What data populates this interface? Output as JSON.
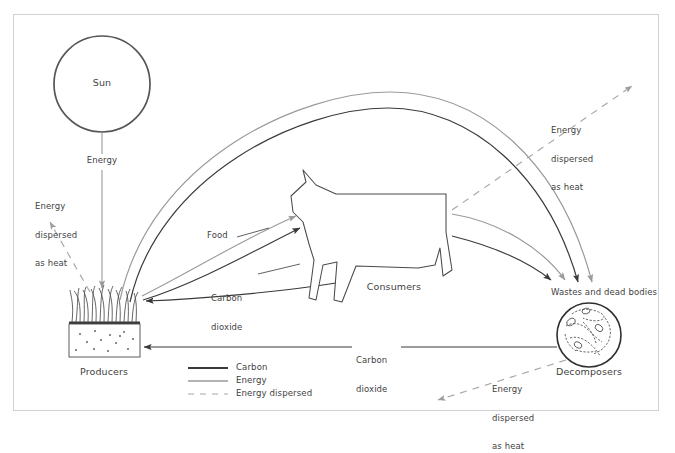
{
  "figure": {
    "frame_color": "#cfcfcf",
    "background": "#ffffff"
  },
  "colors": {
    "carbon": "#3a3a3a",
    "energy": "#9a9a9a",
    "energy_dispersed": "#a8a8a8",
    "text": "#3f3f3f",
    "outline": "#4a4a4a"
  },
  "nodes": {
    "sun": {
      "label": "Sun",
      "cx": 102,
      "cy": 84,
      "r": 48
    },
    "producers": {
      "label": "Producers",
      "x": 104,
      "y": 374
    },
    "consumers": {
      "label": "Consumers",
      "x": 394,
      "y": 289
    },
    "decomposers": {
      "label": "Decomposers",
      "x": 589,
      "y": 374
    },
    "wastes": {
      "label": "Wastes and dead bodies",
      "x": 604,
      "y": 294
    }
  },
  "flow_labels": {
    "energy_from_sun": "Energy",
    "food": "Food",
    "carbon_dioxide_consumers": "Carbon\ndioxide",
    "carbon_dioxide_decomposers": "Carbon\ndioxide",
    "heat_producers": "Energy\ndispersed\nas heat",
    "heat_consumers": "Energy\ndispersed\nas heat",
    "heat_decomposers": "Energy\ndispersed\nas heat"
  },
  "legend": {
    "items": [
      {
        "label": "Carbon",
        "style": "solid",
        "color": "#3a3a3a",
        "width": 1.9
      },
      {
        "label": "Energy",
        "style": "solid",
        "color": "#9a9a9a",
        "width": 1.3
      },
      {
        "label": "Energy dispersed",
        "style": "dashed",
        "color": "#a8a8a8",
        "width": 1.2
      }
    ]
  },
  "flows": [
    {
      "from": "sun",
      "to": "producers",
      "type": "energy",
      "label": "Energy"
    },
    {
      "from": "producers",
      "to": "atmosphere",
      "type": "energy_dispersed",
      "label": "Energy dispersed as heat"
    },
    {
      "from": "producers",
      "to": "consumers",
      "type": "carbon",
      "label": "Food"
    },
    {
      "from": "producers",
      "to": "consumers",
      "type": "energy",
      "label": "Food"
    },
    {
      "from": "consumers",
      "to": "producers",
      "type": "carbon",
      "label": "Carbon dioxide"
    },
    {
      "from": "consumers",
      "to": "atmosphere",
      "type": "energy_dispersed",
      "label": "Energy dispersed as heat"
    },
    {
      "from": "producers",
      "to": "wastes",
      "type": "carbon"
    },
    {
      "from": "producers",
      "to": "wastes",
      "type": "energy"
    },
    {
      "from": "consumers",
      "to": "wastes",
      "type": "carbon"
    },
    {
      "from": "consumers",
      "to": "wastes",
      "type": "energy"
    },
    {
      "from": "decomposers",
      "to": "producers",
      "type": "carbon",
      "label": "Carbon dioxide"
    },
    {
      "from": "decomposers",
      "to": "atmosphere",
      "type": "energy_dispersed",
      "label": "Energy dispersed as heat"
    }
  ]
}
